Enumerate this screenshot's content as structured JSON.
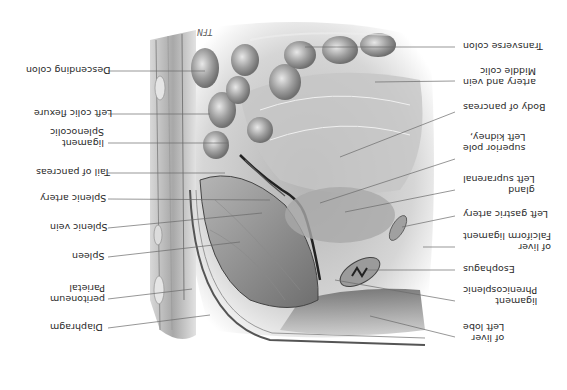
{
  "figure": {
    "orientation": "rotated-180",
    "signature": "TFN",
    "left_labels": [
      {
        "id": "descending-colon",
        "lines": [
          "Descending colon"
        ]
      },
      {
        "id": "left-colic-flexure",
        "lines": [
          "Left colic flexure"
        ]
      },
      {
        "id": "splenocolic-ligament",
        "lines": [
          "Splenocolic",
          "ligament"
        ]
      },
      {
        "id": "tail-of-pancreas",
        "lines": [
          "Tail of pancreas"
        ]
      },
      {
        "id": "splenic-artery",
        "lines": [
          "Splenic artery"
        ]
      },
      {
        "id": "splenic-vein",
        "lines": [
          "Splenic vein"
        ]
      },
      {
        "id": "spleen",
        "lines": [
          "Spleen"
        ]
      },
      {
        "id": "parietal-peritoneum",
        "lines": [
          "Parietal",
          "peritoneum"
        ]
      },
      {
        "id": "diaphragm",
        "lines": [
          "Diaphragm"
        ]
      }
    ],
    "right_labels": [
      {
        "id": "transverse-colon",
        "lines": [
          "Transverse colon"
        ]
      },
      {
        "id": "middle-colic-artery-vein",
        "lines": [
          "Middle colic",
          "artery and vein"
        ]
      },
      {
        "id": "body-of-pancreas",
        "lines": [
          "Body of pancreas"
        ]
      },
      {
        "id": "left-kidney-superior-pole",
        "lines": [
          "Left kidney,",
          "superior pole"
        ]
      },
      {
        "id": "left-suprarenal-gland",
        "lines": [
          "Left suprarenal",
          "gland"
        ]
      },
      {
        "id": "left-gastric-artery",
        "lines": [
          "Left gastric artery"
        ]
      },
      {
        "id": "falciform-ligament",
        "lines": [
          "Falciform ligament",
          "of liver"
        ]
      },
      {
        "id": "esophagus",
        "lines": [
          "Esophagus"
        ]
      },
      {
        "id": "phrenicosplenic-ligament",
        "lines": [
          "Phrenicosplenic",
          "ligament"
        ]
      },
      {
        "id": "left-lobe-of-liver",
        "lines": [
          "Left lobe",
          "of liver"
        ]
      }
    ]
  }
}
